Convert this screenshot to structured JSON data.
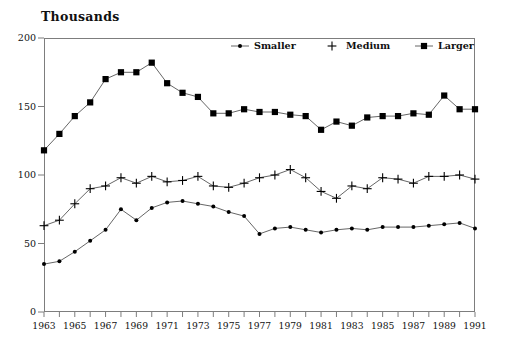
{
  "chart_data": {
    "type": "line",
    "title": "Thousands",
    "xlabel": "",
    "ylabel": "",
    "ylim": [
      0,
      200
    ],
    "yticks": [
      0,
      50,
      100,
      150,
      200
    ],
    "xlim": [
      1963,
      1991
    ],
    "xticks": [
      1963,
      1964,
      1965,
      1966,
      1967,
      1968,
      1969,
      1970,
      1971,
      1972,
      1973,
      1974,
      1975,
      1976,
      1977,
      1978,
      1979,
      1980,
      1981,
      1982,
      1983,
      1984,
      1985,
      1986,
      1987,
      1988,
      1989,
      1990,
      1991
    ],
    "xtick_labels": [
      "1963",
      "",
      "1965",
      "",
      "1967",
      "",
      "1969",
      "",
      "1971",
      "",
      "1973",
      "",
      "1975",
      "",
      "1977",
      "",
      "1979",
      "",
      "1981",
      "",
      "1983",
      "",
      "1985",
      "",
      "1987",
      "",
      "1989",
      "",
      "1991"
    ],
    "grid": false,
    "legend_position": "top-right-inside",
    "x": [
      1963,
      1964,
      1965,
      1966,
      1967,
      1968,
      1969,
      1970,
      1971,
      1972,
      1973,
      1974,
      1975,
      1976,
      1977,
      1978,
      1979,
      1980,
      1981,
      1982,
      1983,
      1984,
      1985,
      1986,
      1987,
      1988,
      1989,
      1990,
      1991
    ],
    "series": [
      {
        "name": "Smaller",
        "marker": "dot",
        "values": [
          35,
          37,
          44,
          52,
          60,
          75,
          67,
          76,
          80,
          81,
          79,
          77,
          73,
          70,
          57,
          61,
          62,
          60,
          58,
          60,
          61,
          60,
          62,
          62,
          62,
          63,
          64,
          65,
          61
        ]
      },
      {
        "name": "Medium",
        "marker": "plus",
        "values": [
          63,
          67,
          79,
          90,
          92,
          98,
          94,
          99,
          95,
          96,
          99,
          92,
          91,
          94,
          98,
          100,
          104,
          98,
          88,
          83,
          92,
          90,
          98,
          97,
          94,
          99,
          99,
          100,
          97
        ]
      },
      {
        "name": "Larger",
        "marker": "square",
        "values": [
          118,
          130,
          143,
          153,
          170,
          175,
          175,
          182,
          167,
          160,
          157,
          145,
          145,
          148,
          146,
          146,
          144,
          143,
          133,
          139,
          136,
          142,
          143,
          143,
          145,
          144,
          158,
          148,
          148
        ]
      }
    ]
  },
  "legend": {
    "entries": [
      {
        "label": "Smaller",
        "marker": "dot"
      },
      {
        "label": "Medium",
        "marker": "plus"
      },
      {
        "label": "Larger",
        "marker": "square"
      }
    ]
  },
  "colors": {
    "line": "#555555",
    "marker": "#000000",
    "frame": "#7d7d7d",
    "text": "#111111",
    "background": "#ffffff"
  }
}
